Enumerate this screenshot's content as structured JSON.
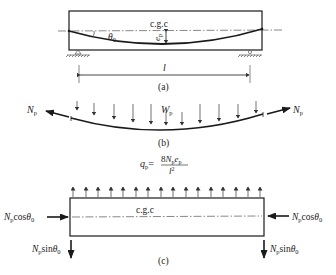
{
  "panel_a": {
    "cgc_label": "c.g.c",
    "angle_label": "θ",
    "angle_sub": "0",
    "ecc_label": "e",
    "ecc_sub": "p",
    "span_label": "l",
    "caption": "(a)"
  },
  "panel_b": {
    "load_label": "W",
    "load_sub": "p",
    "force_left": "N",
    "force_left_sub": "p",
    "force_right": "N",
    "force_right_sub": "p",
    "caption": "(b)"
  },
  "panel_c": {
    "formula_lhs": "q",
    "formula_lhs_sub": "p",
    "formula_eq": "=",
    "formula_num_coef": "8",
    "formula_num_n": "N",
    "formula_num_n_sub": "p",
    "formula_num_e": "e",
    "formula_num_e_sub": "p",
    "formula_den": "l",
    "formula_den_exp": "2",
    "cgc_label": "c.g.c",
    "left_axial_n": "N",
    "left_axial_sub": "p",
    "left_axial_fn": "cos",
    "left_axial_theta": "θ",
    "left_axial_theta_sub": "0",
    "right_axial_n": "N",
    "right_axial_sub": "p",
    "right_axial_fn": "cos",
    "right_axial_theta": "θ",
    "right_axial_theta_sub": "0",
    "left_shear_n": "N",
    "left_shear_sub": "p",
    "left_shear_fn": "sin",
    "left_shear_theta": "θ",
    "left_shear_theta_sub": "0",
    "right_shear_n": "N",
    "right_shear_sub": "p",
    "right_shear_fn": "sin",
    "right_shear_theta": "θ",
    "right_shear_theta_sub": "0",
    "caption": "(c)"
  }
}
